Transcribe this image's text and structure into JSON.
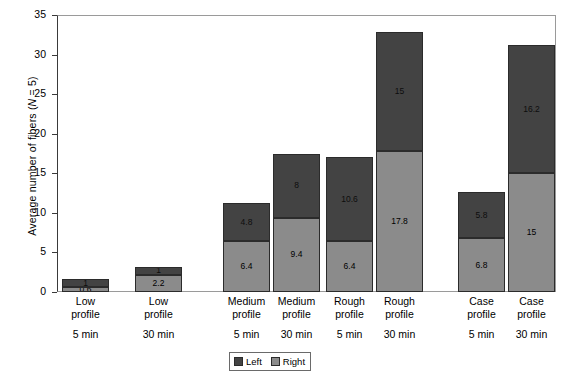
{
  "chart_data": {
    "type": "bar",
    "subtype": "stacked",
    "title": "",
    "xlabel": "",
    "ylabel": "Average number of fibers (N = 5)",
    "ylabel_parts": {
      "pre": "Average  number of fibers (",
      "italic": "N",
      "post": " = 5)"
    },
    "ylim": [
      0,
      35
    ],
    "yticks": [
      0,
      5,
      10,
      15,
      20,
      25,
      30,
      35
    ],
    "ytick_labels": [
      "0",
      "5",
      "10",
      "15",
      "20",
      "25",
      "30",
      "35"
    ],
    "grid": false,
    "legend_position": "bottom-center",
    "categories": [
      "Low profile 5 min",
      "Low profile 30 min",
      "Medium profile 5 min",
      "Medium profile 30 min",
      "Rough profile 5 min",
      "Rough profile 30 min",
      "Case profile 5 min",
      "Case profile 30 min"
    ],
    "category_lines": [
      {
        "profile": "Low",
        "profile2": "profile",
        "time": "5 min"
      },
      {
        "profile": "Low",
        "profile2": "profile",
        "time": "30 min"
      },
      {
        "profile": "Medium",
        "profile2": "profile",
        "time": "5 min"
      },
      {
        "profile": "Medium",
        "profile2": "profile",
        "time": "30 min"
      },
      {
        "profile": "Rough",
        "profile2": "profile",
        "time": "5 min"
      },
      {
        "profile": "Rough",
        "profile2": "profile",
        "time": "30 min"
      },
      {
        "profile": "Case",
        "profile2": "profile",
        "time": "5 min"
      },
      {
        "profile": "Case",
        "profile2": "profile",
        "time": "30 min"
      }
    ],
    "series": [
      {
        "name": "Right",
        "color": "#8b8b8b",
        "values": [
          0.6,
          2.2,
          6.4,
          9.4,
          6.4,
          17.8,
          6.8,
          15
        ],
        "labels": [
          "0.6",
          "2.2",
          "6.4",
          "9.4",
          "6.4",
          "17.8",
          "6.8",
          "15"
        ]
      },
      {
        "name": "Left",
        "color": "#434343",
        "values": [
          1,
          1,
          4.8,
          8,
          10.6,
          15,
          5.8,
          16.2
        ],
        "labels": [
          "1",
          "1",
          "4.8",
          "8",
          "10.6",
          "15",
          "5.8",
          "16.2"
        ]
      }
    ],
    "totals": [
      1.6,
      3.2,
      11.2,
      17.4,
      17.0,
      32.8,
      12.6,
      31.2
    ]
  },
  "legend": {
    "items": [
      {
        "label": "Left",
        "color": "#434343"
      },
      {
        "label": "Right",
        "color": "#8b8b8b"
      }
    ]
  },
  "colors": {
    "left": "#434343",
    "right": "#8b8b8b",
    "axis": "#3a3a3a",
    "frame": "#9a9a9a",
    "background": "#ffffff"
  }
}
